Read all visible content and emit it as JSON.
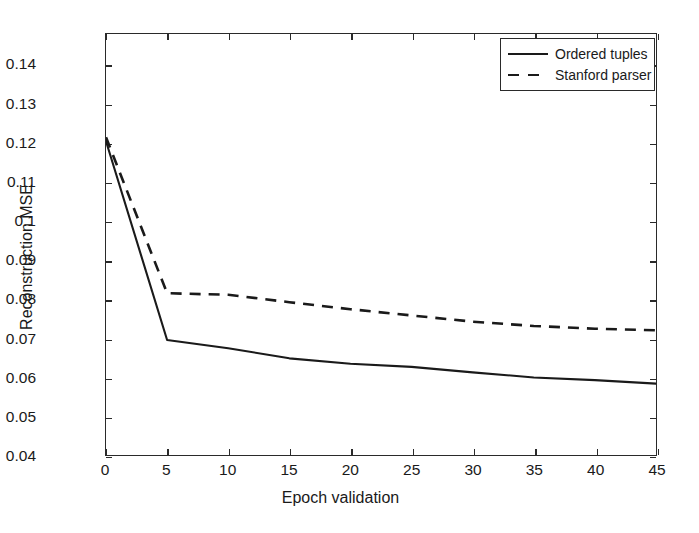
{
  "chart_data": {
    "type": "line",
    "title": "",
    "xlabel": "Epoch validation",
    "ylabel": "Reconstruction MSE",
    "xlim": [
      0,
      45
    ],
    "ylim": [
      0.04,
      0.148
    ],
    "grid": false,
    "legend_position": "top-right",
    "xticks": [
      0,
      5,
      10,
      15,
      20,
      25,
      30,
      35,
      40,
      45
    ],
    "xtick_labels": [
      "0",
      "5",
      "10",
      "15",
      "20",
      "25",
      "30",
      "35",
      "40",
      "45"
    ],
    "yticks": [
      0.04,
      0.05,
      0.06,
      0.07,
      0.08,
      0.09,
      0.1,
      0.11,
      0.12,
      0.13,
      0.14
    ],
    "ytick_labels": [
      "0.04",
      "0.05",
      "0.06",
      "0.07",
      "0.08",
      "0.09",
      "0.1",
      "0.11",
      "0.12",
      "0.13",
      "0.14"
    ],
    "x": [
      0,
      5,
      10,
      15,
      20,
      25,
      30,
      35,
      40,
      45
    ],
    "series": [
      {
        "name": "Ordered tuples",
        "style": "solid",
        "color": "#1a1a1a",
        "values": [
          0.1205,
          0.0695,
          0.0674,
          0.0648,
          0.0634,
          0.0626,
          0.0612,
          0.0599,
          0.0592,
          0.0583
        ]
      },
      {
        "name": "Stanford parser",
        "style": "dashed",
        "color": "#1a1a1a",
        "values": [
          0.1215,
          0.0815,
          0.0811,
          0.0792,
          0.0774,
          0.0758,
          0.0742,
          0.0731,
          0.0724,
          0.072
        ]
      }
    ]
  },
  "legend": {
    "items": [
      {
        "label": "Ordered tuples",
        "style": "solid"
      },
      {
        "label": "Stanford parser",
        "style": "dashed"
      }
    ]
  },
  "axes": {
    "x_title": "Epoch validation",
    "y_title": "Reconstruction MSE"
  }
}
